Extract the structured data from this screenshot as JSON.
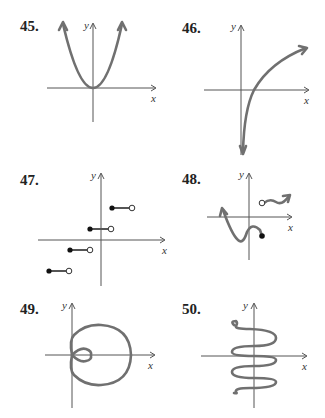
{
  "problems": [
    {
      "number": "45.",
      "description": "Parabola opening upward, vertex at origin, arrows at both ends",
      "x_label": "x",
      "y_label": "y"
    },
    {
      "number": "46.",
      "description": "Logarithmic-type curve: vertical asymptote near y-axis going down, increasing to the right with arrow",
      "x_label": "x",
      "y_label": "y"
    },
    {
      "number": "47.",
      "description": "Step function with four segments, closed dot on left end, open dot on right end",
      "x_label": "x",
      "y_label": "y"
    },
    {
      "number": "48.",
      "description": "Curve from upper-left down through a minimum, up, then down ending at closed dot; separate piece starting at open dot going right with arrow",
      "x_label": "x",
      "y_label": "y"
    },
    {
      "number": "49.",
      "description": "Limaçon with inner loop, symmetric about x-axis",
      "x_label": "x",
      "y_label": "y"
    },
    {
      "number": "50.",
      "description": "Vertical sinusoidal curve oscillating about the y-axis",
      "x_label": "x",
      "y_label": "y"
    }
  ]
}
